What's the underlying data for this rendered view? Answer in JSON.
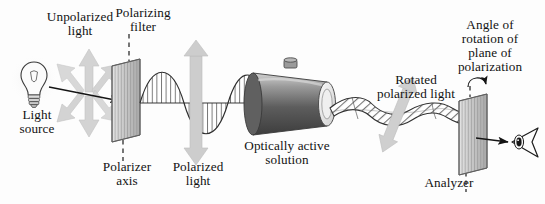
{
  "figure": {
    "background_color": "#fdfdfd",
    "ink_color": "#121212",
    "arrow_gray": "#c9c9c9",
    "plate_gray": "#b9b9b9",
    "tube_dark": "#4a4a4a",
    "tube_light": "#d8d8d8"
  },
  "labels": {
    "unpolarized_light": "Unpolarized\nlight",
    "polarizing_filter": "Polarizing\nfilter",
    "light_source": "Light\nsource",
    "polarizer_axis": "Polarizer\naxis",
    "polarized_light": "Polarized\nlight",
    "optically_active_solution": "Optically active\nsolution",
    "rotated_polarized_light": "Rotated\npolarized light",
    "angle_of_rotation": "Angle of\nrotation of\nplane of\npolarization",
    "analyzer": "Analyzer"
  },
  "components": [
    {
      "name": "light-source-bulb",
      "kind": "incandescent-bulb",
      "x": 34,
      "y": 76
    },
    {
      "name": "unpolarized-light-burst",
      "kind": "multi-direction-arrow-star",
      "x": 88,
      "y": 88
    },
    {
      "name": "polarizing-filter-plate",
      "kind": "striated-parallelogram-plate",
      "x": 128,
      "y": 100
    },
    {
      "name": "polarizer-axis-dashed-line",
      "kind": "vertical-dashed-line",
      "x": 128
    },
    {
      "name": "polarized-wave",
      "kind": "hatched-sine-wave",
      "from_x": 140,
      "to_x": 252
    },
    {
      "name": "polarization-plane-double-arrow",
      "kind": "vertical-double-arrow",
      "x": 196,
      "y": 102
    },
    {
      "name": "sample-tube",
      "kind": "cylinder-with-stopper",
      "x": 290,
      "y": 104
    },
    {
      "name": "rotated-light-helix",
      "kind": "hatched-helix-ribbon",
      "from_x": 330,
      "to_x": 470
    },
    {
      "name": "rotated-plane-double-arrow",
      "kind": "tilted-double-arrow",
      "x": 398,
      "y": 112
    },
    {
      "name": "angle-rotation-curved-arrow",
      "kind": "curved-arrow",
      "x": 470,
      "y": 84
    },
    {
      "name": "analyzer-plate",
      "kind": "striated-parallelogram-plate",
      "x": 476,
      "y": 134
    },
    {
      "name": "analyzer-axis-dashed-line",
      "kind": "vertical-dashed-line",
      "x": 476
    },
    {
      "name": "observer-eye",
      "kind": "eye",
      "x": 516,
      "y": 142
    }
  ]
}
